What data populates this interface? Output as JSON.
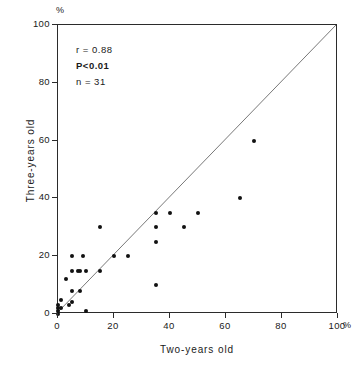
{
  "chart_data": {
    "type": "scatter",
    "title": "",
    "xlabel": "Two-years old",
    "ylabel": "Three-years old",
    "x_unit": "%",
    "y_unit": "%",
    "xlim": [
      0,
      100
    ],
    "ylim": [
      0,
      100
    ],
    "xticks": [
      0,
      20,
      40,
      60,
      80,
      100
    ],
    "yticks": [
      0,
      20,
      40,
      60,
      80,
      100
    ],
    "xtick_labels": [
      "0",
      "20",
      "40",
      "60",
      "80",
      "100"
    ],
    "ytick_labels": [
      "0",
      "20",
      "40",
      "60",
      "80",
      "100"
    ],
    "grid": false,
    "legend": false,
    "reference_line": {
      "name": "identity-line",
      "from": [
        0,
        0
      ],
      "to": [
        100,
        100
      ],
      "color": "#555555"
    },
    "marker_color": "#111111",
    "points": [
      [
        0,
        0
      ],
      [
        0,
        1
      ],
      [
        0,
        2
      ],
      [
        0,
        3
      ],
      [
        1,
        2
      ],
      [
        1,
        5
      ],
      [
        3,
        12
      ],
      [
        4,
        3
      ],
      [
        5,
        4
      ],
      [
        5,
        8
      ],
      [
        5,
        15
      ],
      [
        5,
        20
      ],
      [
        7,
        15
      ],
      [
        8,
        8
      ],
      [
        8,
        15
      ],
      [
        9,
        20
      ],
      [
        10,
        1
      ],
      [
        10,
        15
      ],
      [
        15,
        15
      ],
      [
        15,
        30
      ],
      [
        25,
        20
      ],
      [
        35,
        10
      ],
      [
        35,
        25
      ],
      [
        35,
        30
      ],
      [
        35,
        35
      ],
      [
        40,
        35
      ],
      [
        45,
        30
      ],
      [
        50,
        35
      ],
      [
        65,
        40
      ],
      [
        70,
        60
      ],
      [
        20,
        20
      ]
    ],
    "annotations": {
      "r_label": "r = 0.88",
      "p_label": "P<0.01",
      "n_label": "n = 31"
    }
  },
  "axes": {
    "y_percent": "%",
    "x_percent": "%"
  }
}
